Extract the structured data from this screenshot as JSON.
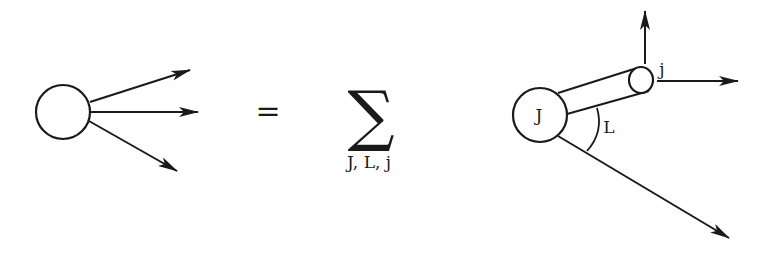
{
  "diagram": {
    "colors": {
      "stroke": "#1a1a1a",
      "background": "#ffffff"
    },
    "left_vertex": {
      "label": "",
      "outgoing_arrows": 3
    },
    "equals_sign": "=",
    "summation": {
      "symbol": "∑",
      "indices": "J, L, j"
    },
    "right_diagram": {
      "parent_label": "J",
      "angular_momentum_label": "L",
      "subsystem_label": "j",
      "outgoing_arrows": 3
    }
  }
}
